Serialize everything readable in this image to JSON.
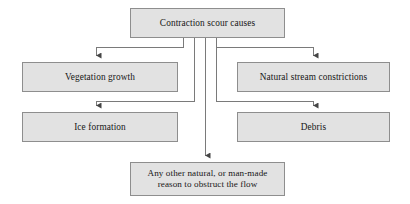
{
  "diagram": {
    "type": "flowchart",
    "title": "Contraction scour causes",
    "colors": {
      "node_fill": "#e2e2e2",
      "node_border": "#8e8e8e",
      "text": "#161616",
      "connector": "#6f6f6f",
      "background": "#ffffff"
    },
    "nodes": {
      "root": {
        "label": "Contraction scour causes",
        "level": 0
      },
      "vegetation_growth": {
        "label": "Vegetation growth",
        "level": 1,
        "side": "left"
      },
      "natural_stream_constrictions": {
        "label": "Natural stream constrictions",
        "level": 1,
        "side": "right"
      },
      "ice_formation": {
        "label": "Ice formation",
        "level": 2,
        "side": "left"
      },
      "debris": {
        "label": "Debris",
        "level": 2,
        "side": "right"
      },
      "any_other": {
        "label": "Any other natural, or man-made\nreason to obstruct the flow",
        "level": 3,
        "side": "center"
      }
    },
    "edges": [
      {
        "from": "root",
        "to": "vegetation_growth"
      },
      {
        "from": "root",
        "to": "natural_stream_constrictions"
      },
      {
        "from": "root",
        "to": "ice_formation"
      },
      {
        "from": "root",
        "to": "debris"
      },
      {
        "from": "root",
        "to": "any_other"
      }
    ]
  }
}
